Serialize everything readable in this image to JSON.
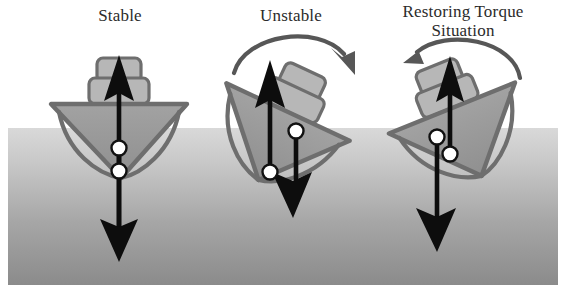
{
  "figure": {
    "type": "schematic-diagram",
    "width": 567,
    "height": 292,
    "background": "#ffffff"
  },
  "colors": {
    "hull_fill": "#9a9a9a",
    "hull_stroke": "#6e6e6e",
    "superstructure_fill": "#b5b5b5",
    "superstructure_stroke": "#6e6e6e",
    "arrow_black": "#0d0d0d",
    "curve_arrow": "#575757",
    "dot_fill": "#ffffff",
    "dot_stroke": "#111111",
    "water_top": "#d4d4d4",
    "water_bottom": "#8d8d8d",
    "label_text": "#2b2b2b"
  },
  "water": {
    "label": "water-surface",
    "x": 8,
    "y": 128,
    "width": 550,
    "height": 157,
    "gradient_from": "#d4d4d4",
    "gradient_to": "#8d8d8d"
  },
  "panels": [
    {
      "id": "stable",
      "label": "Stable",
      "heel_degrees": 0,
      "center_x": 120,
      "description": "Upright vessel: centre of gravity above centre of buoyancy on the same vertical line, no rotating couple.",
      "markers": [
        {
          "name": "center-of-gravity-dot",
          "cx": 119,
          "cy": 148
        },
        {
          "name": "center-of-buoyancy-dot",
          "cx": 119,
          "cy": 171
        }
      ],
      "force_arrows": [
        {
          "name": "buoyancy-arrow-up",
          "direction": "up",
          "from_x": 119,
          "from_y": 240,
          "to_x": 119,
          "to_y": 58
        },
        {
          "name": "gravity-arrow-down",
          "direction": "down",
          "from_x": 119,
          "from_y": 150,
          "to_x": 119,
          "to_y": 258
        }
      ],
      "rotation_arrow": null
    },
    {
      "id": "unstable",
      "label": "Unstable",
      "heel_degrees": 25,
      "center_x": 290,
      "description": "Heeled vessel: centre of gravity lies outboard of the centre of buoyancy, producing a capsizing couple turning clockwise.",
      "markers": [
        {
          "name": "center-of-gravity-dot",
          "cx": 297,
          "cy": 131
        },
        {
          "name": "center-of-buoyancy-dot",
          "cx": 270,
          "cy": 172
        }
      ],
      "force_arrows": [
        {
          "name": "buoyancy-arrow-up",
          "direction": "up",
          "from_x": 270,
          "from_y": 172,
          "to_x": 270,
          "to_y": 62
        },
        {
          "name": "gravity-arrow-down",
          "direction": "down",
          "from_x": 297,
          "from_y": 131,
          "to_x": 297,
          "to_y": 216
        }
      ],
      "rotation_arrow": {
        "name": "capsizing-torque-arc",
        "direction": "clockwise",
        "sense": "left-to-right"
      }
    },
    {
      "id": "restoring-torque",
      "label": "Restoring Torque\nSituation",
      "label_line_1": "Restoring Torque",
      "label_line_2": "Situation",
      "heel_degrees": -22,
      "center_x": 455,
      "description": "Heeled vessel: centre of buoyancy shifts outboard of the centre of gravity, producing a righting couple turning counter-clockwise.",
      "markers": [
        {
          "name": "center-of-gravity-dot",
          "cx": 437,
          "cy": 137
        },
        {
          "name": "center-of-buoyancy-dot",
          "cx": 450,
          "cy": 154
        }
      ],
      "force_arrows": [
        {
          "name": "buoyancy-arrow-up",
          "direction": "up",
          "from_x": 450,
          "from_y": 160,
          "to_x": 450,
          "to_y": 58
        },
        {
          "name": "gravity-arrow-down",
          "direction": "down",
          "from_x": 437,
          "from_y": 137,
          "to_x": 437,
          "to_y": 250
        }
      ],
      "rotation_arrow": {
        "name": "restoring-torque-arc",
        "direction": "counter-clockwise",
        "sense": "right-to-left"
      }
    }
  ]
}
